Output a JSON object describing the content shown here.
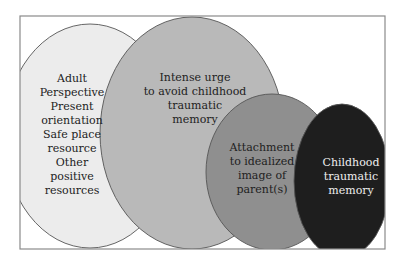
{
  "diagram": {
    "frame": {
      "x": 20,
      "y": 16,
      "width": 365,
      "height": 233,
      "stroke": "#8a8a8a"
    },
    "ellipses": [
      {
        "id": "adult-resources",
        "cx": 90,
        "cy": 136,
        "rx": 86,
        "ry": 112,
        "fill": "#ececec",
        "text_color": "#222222",
        "text_x": 72,
        "text_y0": 82,
        "line_height": 14,
        "lines": [
          "Adult",
          "Perspective",
          "Present",
          "orientation",
          "Safe place",
          "resource",
          "Other",
          "positive",
          "resources"
        ]
      },
      {
        "id": "avoidance-urge",
        "cx": 192,
        "cy": 133,
        "rx": 92,
        "ry": 116,
        "fill": "#b9b9b9",
        "text_color": "#222222",
        "text_x": 195,
        "text_y0": 81,
        "line_height": 14,
        "lines": [
          "Intense urge",
          "to avoid childhood",
          "traumatic",
          "memory"
        ]
      },
      {
        "id": "idealized-attachment",
        "cx": 272,
        "cy": 172,
        "rx": 66,
        "ry": 78,
        "fill": "#8f8f8f",
        "text_color": "#1e1e1e",
        "text_x": 262,
        "text_y0": 151,
        "line_height": 14,
        "lines": [
          "Attachment",
          "to idealized",
          "image of",
          "parent(s)"
        ]
      },
      {
        "id": "childhood-trauma",
        "cx": 342,
        "cy": 181,
        "rx": 48,
        "ry": 77,
        "fill": "#1e1e1e",
        "text_color": "#eeeeee",
        "text_x": 351,
        "text_y0": 166,
        "line_height": 14,
        "lines": [
          "Childhood",
          "traumatic",
          "memory"
        ]
      }
    ]
  }
}
